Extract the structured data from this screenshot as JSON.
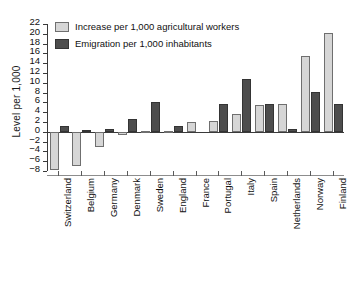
{
  "chart_data": {
    "type": "bar",
    "title": "",
    "xlabel": "",
    "ylabel": "Level per 1,000",
    "ylim": [
      -8,
      22
    ],
    "ytick_step": 2,
    "yticks": [
      22,
      20,
      18,
      16,
      14,
      12,
      10,
      8,
      6,
      4,
      2,
      0,
      -2,
      -4,
      -6,
      -8
    ],
    "grid": false,
    "legend_position": "top-left",
    "categories": [
      "Switzerland",
      "Belgium",
      "Germany",
      "Denmark",
      "Sweden",
      "England",
      "France",
      "Portugal",
      "Italy",
      "Spain",
      "Netherlands",
      "Norway",
      "Finland"
    ],
    "series": [
      {
        "name": "Increase per 1,000 agricultural workers",
        "color": "#d6d6d6",
        "values": [
          -7.8,
          -6.9,
          -3.1,
          -0.7,
          0.2,
          0.2,
          2.0,
          2.3,
          3.7,
          5.4,
          5.6,
          15.4,
          20.2
        ]
      },
      {
        "name": "Emigration per 1,000 inhabitants",
        "color": "#4d4d4d",
        "values": [
          1.1,
          0.4,
          0.5,
          2.7,
          6.0,
          1.1,
          0.0,
          5.7,
          10.8,
          5.7,
          0.5,
          8.2,
          5.6
        ]
      }
    ]
  },
  "legend": {
    "items": [
      {
        "label": "Increase per 1,000 agricultural workers",
        "swatch": "light-gray-swatch"
      },
      {
        "label": "Emigration per 1,000 inhabitants",
        "swatch": "dark-gray-swatch"
      }
    ]
  },
  "colors": {
    "increase": "#d6d6d6",
    "emigration": "#4d4d4d",
    "axis": "#3a3a3a",
    "text": "#111111",
    "background": "#ffffff"
  }
}
